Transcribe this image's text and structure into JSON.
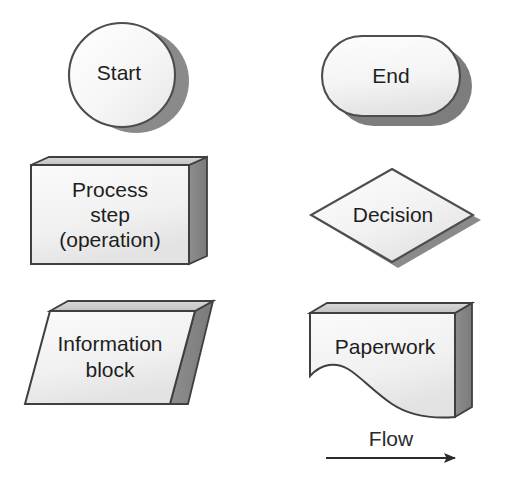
{
  "figure": {
    "kind": "flowchart-symbol-legend",
    "background_color": "#ffffff",
    "shapes": [
      {
        "id": "start",
        "symbol_name": "circle",
        "label": "Start",
        "meaning": "Start terminator",
        "fill_color": "#f7f7f7",
        "shadow_color": "#8a8a8a",
        "outline_color": "#4d4d4d"
      },
      {
        "id": "end",
        "symbol_name": "rounded-pill",
        "label": "End",
        "meaning": "End terminator",
        "fill_color": "#f7f7f7",
        "shadow_color": "#7d7d7d",
        "outline_color": "#4d4d4d"
      },
      {
        "id": "process",
        "symbol_name": "rectangle",
        "label_lines": [
          "Process",
          "step",
          "(operation)"
        ],
        "label": "Process step (operation)",
        "meaning": "Process step / operation",
        "fill_color": "#f2f2f2",
        "shadow_color": "#808080",
        "outline_color": "#3f3f3f"
      },
      {
        "id": "decision",
        "symbol_name": "diamond",
        "label": "Decision",
        "meaning": "Decision point",
        "fill_color": "#f4f4f4",
        "shadow_color": "#8a8a8a",
        "outline_color": "#4d4d4d"
      },
      {
        "id": "information",
        "symbol_name": "parallelogram",
        "label_lines": [
          "Information",
          "block"
        ],
        "label": "Information block",
        "meaning": "Information block / data",
        "fill_color": "#f4f4f4",
        "shadow_color": "#787878",
        "outline_color": "#3f3f3f"
      },
      {
        "id": "paperwork",
        "symbol_name": "wavy-bottom-document",
        "label": "Paperwork",
        "meaning": "Paperwork / document",
        "fill_color": "#f1f1f1",
        "shadow_color": "#8d8d8d",
        "outline_color": "#3f3f3f"
      }
    ],
    "flow_arrow": {
      "label": "Flow",
      "meaning": "Direction of flow",
      "line_color": "#2b2b2b",
      "direction": "left-to-right"
    }
  }
}
